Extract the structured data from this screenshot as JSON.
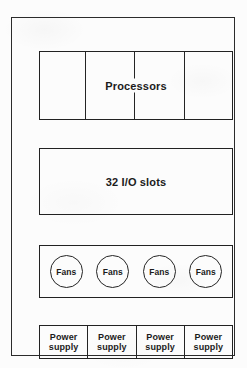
{
  "diagram": {
    "stroke_color": "#222222",
    "background_color": "#fcfcfc",
    "chassis": {
      "name": "chassis-outline"
    },
    "modules": [
      {
        "id": "processors",
        "label": "Processors",
        "cells": 4,
        "divider_count": 3
      },
      {
        "id": "io",
        "label": "32 I/O slots",
        "cells": 1,
        "divider_count": 0
      },
      {
        "id": "fans",
        "label": "Fans",
        "cells": 4,
        "divider_count": 0
      },
      {
        "id": "power",
        "label_line1": "Power",
        "label_line2": "supply",
        "cells": 4,
        "divider_count": 3
      }
    ],
    "processors": {
      "label": "Processors"
    },
    "io_slots": {
      "label": "32 I/O slots"
    },
    "fans": {
      "units": [
        {
          "label": "Fans"
        },
        {
          "label": "Fans"
        },
        {
          "label": "Fans"
        },
        {
          "label": "Fans"
        }
      ]
    },
    "power_supplies": {
      "units": [
        {
          "line1": "Power",
          "line2": "supply"
        },
        {
          "line1": "Power",
          "line2": "supply"
        },
        {
          "line1": "Power",
          "line2": "supply"
        },
        {
          "line1": "Power",
          "line2": "supply"
        }
      ]
    }
  }
}
